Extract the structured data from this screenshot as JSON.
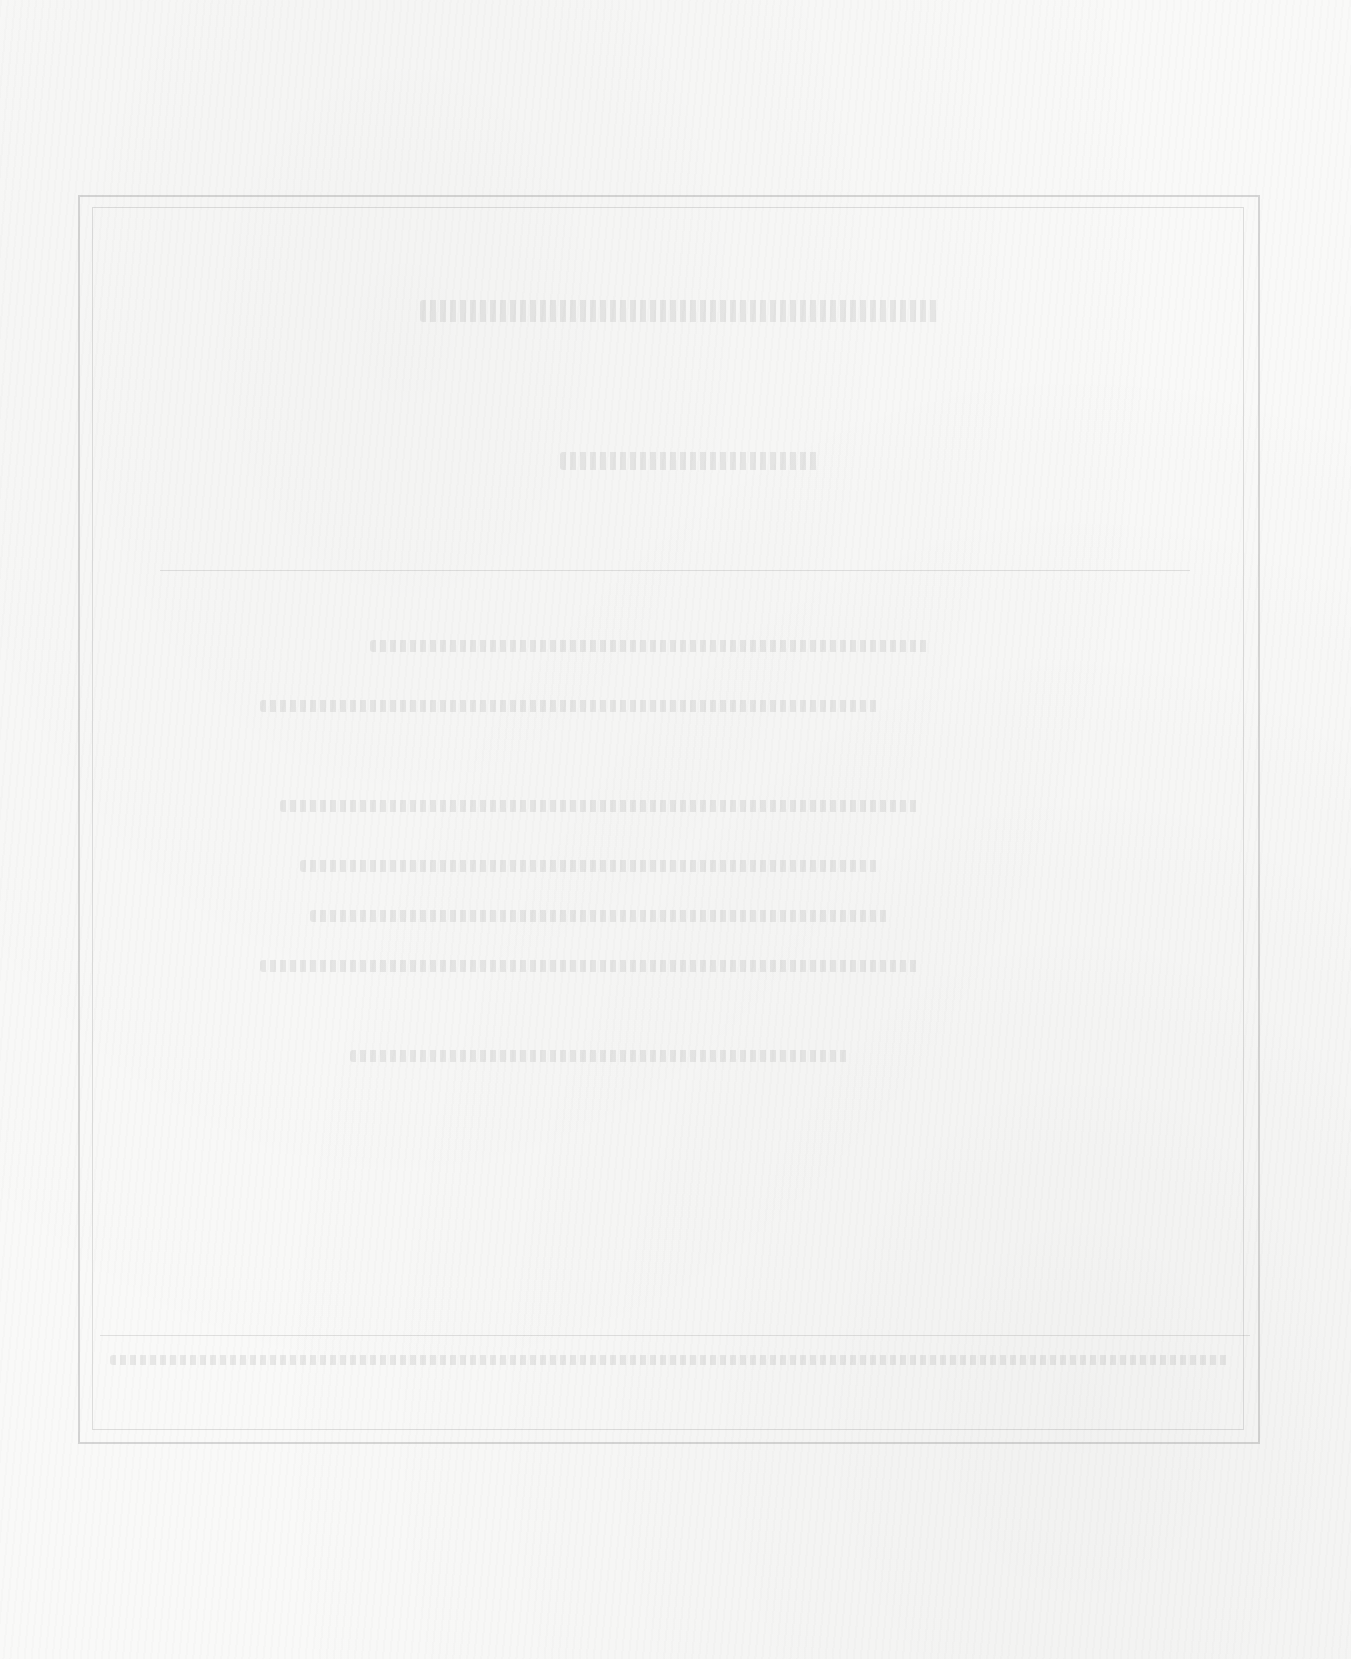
{
  "page": {
    "type": "scanned blank page with bleed-through",
    "legible_text": [],
    "frame": {
      "style": "double-rule border",
      "color": "#8a8a8a"
    },
    "background_color": "#f9f9f8"
  }
}
